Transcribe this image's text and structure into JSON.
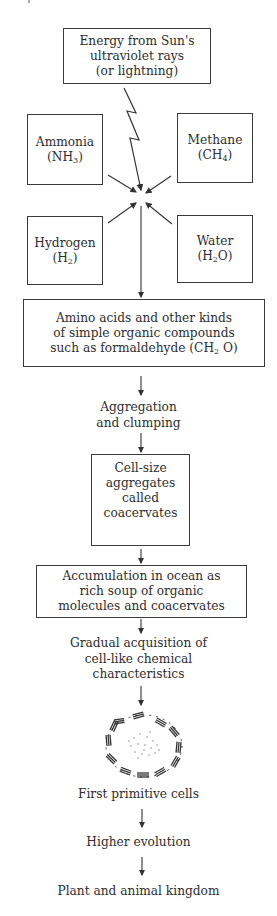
{
  "diagram": {
    "type": "flowchart",
    "topic": "Origin of life (chemical evolution)",
    "energy_box": {
      "lines": [
        "Energy from Sun's",
        "ultraviolet rays",
        "(or lightning)"
      ]
    },
    "reactants": [
      {
        "name": "Ammonia",
        "formula_main": "(NH",
        "formula_sub": "3",
        "formula_end": ")"
      },
      {
        "name": "Methane",
        "formula_main": "(CH",
        "formula_sub": "4",
        "formula_end": ")"
      },
      {
        "name": "Hydrogen",
        "formula_main": "(H",
        "formula_sub": "2",
        "formula_end": ")"
      },
      {
        "name": "Water",
        "formula_main": "(H",
        "formula_sub": "2",
        "formula_end": "O)"
      }
    ],
    "organic_box": {
      "line1": "Amino acids and other kinds",
      "line2": "of simple organic compounds",
      "line3_main": "such as formaldehyde (CH",
      "line3_sub": "2",
      "line3_end": " O)"
    },
    "step_aggregation": {
      "lines": [
        "Aggregation",
        "and clumping"
      ]
    },
    "coacervate_box": {
      "lines": [
        "Cell-size",
        "aggregates",
        "called",
        "coacervates"
      ]
    },
    "ocean_box": {
      "lines": [
        "Accumulation in ocean as",
        "rich soup of organic",
        "molecules and coacervates"
      ]
    },
    "step_acquisition": {
      "lines": [
        "Gradual acquisition of",
        "cell-like chemical",
        "characteristics"
      ]
    },
    "cell_illustration": {
      "icon": "primitive-cell-icon"
    },
    "step_cells": "First primitive cells",
    "step_evolution": "Higher evolution",
    "step_kingdom": "Plant and animal kingdom",
    "colors": {
      "stroke": "#3a3a3a",
      "text": "#2e2e2e",
      "background": "#ffffff"
    }
  }
}
